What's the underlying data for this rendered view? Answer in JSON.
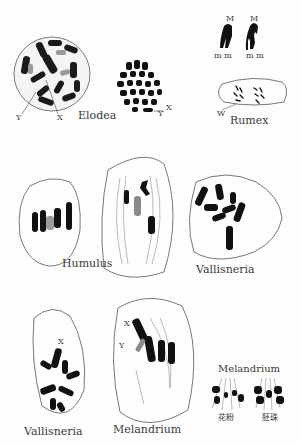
{
  "figure": {
    "ink_color": "#111111",
    "outline_color": "#555555",
    "highlight_color": "#9a9a9a",
    "panels": [
      {
        "id": "elodea-cell",
        "label": "Elodea",
        "markers": [
          "Y",
          "X"
        ]
      },
      {
        "id": "elodea-plate",
        "markers": [
          "X",
          "Y"
        ]
      },
      {
        "id": "m-chromosomes",
        "markers": [
          "M",
          "M"
        ],
        "sublabels": [
          "m m",
          "m m"
        ]
      },
      {
        "id": "rumex",
        "label": "Rumex",
        "markers": [
          "W"
        ]
      },
      {
        "id": "humulus",
        "label": "Humulus"
      },
      {
        "id": "spindle-cell"
      },
      {
        "id": "vallisneria-top",
        "label": "Vallisneria"
      },
      {
        "id": "vallisneria-bottom",
        "label": "Vallisneria",
        "markers": [
          "X"
        ]
      },
      {
        "id": "melandrium-cell",
        "label": "Melandrium",
        "markers": [
          "X",
          "Y"
        ]
      },
      {
        "id": "melandrium-anaphase",
        "label": "Melandrium",
        "sublabels": [
          "花粉",
          "胚珠"
        ]
      }
    ]
  },
  "labels": {
    "elodea": "Elodea",
    "elodea_y": "Y",
    "elodea_x": "X",
    "plate_x": "X",
    "plate_y": "Y",
    "m1": "M",
    "m2": "M",
    "mm1": "m m",
    "mm2": "m m",
    "rumex": "Rumex",
    "rumex_w": "W",
    "humulus": "Humulus",
    "vallisneria_top": "Vallisneria",
    "vallisneria_bottom": "Vallisneria",
    "vallisneria_x": "X",
    "melandrium": "Melandrium",
    "melandrium_x": "X",
    "melandrium_y": "Y",
    "melandrium_right": "Melandrium",
    "pollen": "花粉",
    "ovule": "胚珠"
  }
}
